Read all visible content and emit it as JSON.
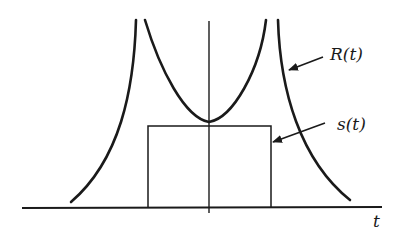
{
  "figure": {
    "labels": {
      "R": "R(t)",
      "s": "s(t)",
      "t": "t"
    },
    "colors": {
      "stroke": "#1a1a1a",
      "background": "#ffffff"
    },
    "elements": [
      "horizontal t-axis",
      "vertical axis at t=0",
      "R(t): U-shaped central curve with vertex at t=0 touching top of s(t)",
      "R(t): two outer branches decaying toward the t-axis",
      "s(t): rectangular pulse centered at t=0"
    ]
  }
}
